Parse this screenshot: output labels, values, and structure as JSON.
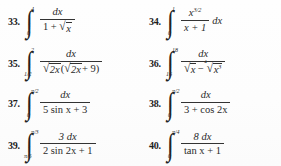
{
  "page": {
    "kind": "textbook-exercise-set",
    "background_color": "#fdfdfd",
    "text_color": "#2b2b2b",
    "columns": 2,
    "rows": 4
  },
  "problems": [
    {
      "number": "33.",
      "column": "left",
      "lower_limit": "0",
      "upper_limit": "4",
      "numerator": "dx",
      "denominator_prefix": "1 +",
      "denominator_radicand": "x",
      "trailing": "",
      "latex": "\\int_{0}^{4} \\frac{dx}{1+\\sqrt{x}}"
    },
    {
      "number": "34.",
      "column": "right",
      "lower_limit": "0",
      "upper_limit": "1",
      "numerator": "x",
      "numerator_exponent": "3/2",
      "denominator": "x + 1",
      "trailing": "dx",
      "latex": "\\int_{0}^{1} \\frac{x^{3/2}}{x+1}\\,dx"
    },
    {
      "number": "35.",
      "column": "left",
      "lower_limit": "1/2",
      "upper_limit": "2",
      "numerator": "dx",
      "denominator_radicand_1": "2x",
      "denominator_radicand_2": "2x",
      "denominator_tail": "+ 9)",
      "trailing": "",
      "latex": "\\int_{1/2}^{2} \\frac{dx}{\\sqrt{2x}(\\sqrt{2x}+9)}"
    },
    {
      "number": "36.",
      "column": "right",
      "lower_limit": "16",
      "upper_limit": "18",
      "numerator": "dx",
      "denominator_radicand_1": "x",
      "denominator_op": "−",
      "denominator_root_index": "4",
      "denominator_radicand_2": "x",
      "denominator_radicand_2_exponent": "3",
      "trailing": "",
      "latex": "\\int_{16}^{18} \\frac{dx}{\\sqrt{x}-\\sqrt[4]{x^{3}}}"
    },
    {
      "number": "37.",
      "column": "left",
      "lower_limit": "0",
      "upper_limit": "π/2",
      "numerator": "dx",
      "denominator": "5 sin x + 3",
      "trailing": "",
      "latex": "\\int_{0}^{\\pi/2} \\frac{dx}{5\\sin x+3}"
    },
    {
      "number": "38.",
      "column": "right",
      "lower_limit": "0",
      "upper_limit": "π/2",
      "numerator": "dx",
      "denominator": "3 + cos 2x",
      "trailing": "",
      "latex": "\\int_{0}^{\\pi/2} \\frac{dx}{3+\\cos 2x}"
    },
    {
      "number": "39.",
      "column": "left",
      "lower_limit": "π/6",
      "upper_limit": "π/3",
      "numerator": "3 dx",
      "denominator": "2 sin 2x + 1",
      "trailing": "",
      "latex": "\\int_{\\pi/6}^{\\pi/3} \\frac{3\\,dx}{2\\sin 2x+1}"
    },
    {
      "number": "40.",
      "column": "right",
      "lower_limit": "0",
      "upper_limit": "π/4",
      "numerator": "8 dx",
      "denominator": "tan x + 1",
      "trailing": "",
      "latex": "\\int_{0}^{\\pi/4} \\frac{8\\,dx}{\\tan x+1}"
    }
  ],
  "glyphs": {
    "integral": "∫",
    "radical": "√",
    "minus": "−"
  }
}
